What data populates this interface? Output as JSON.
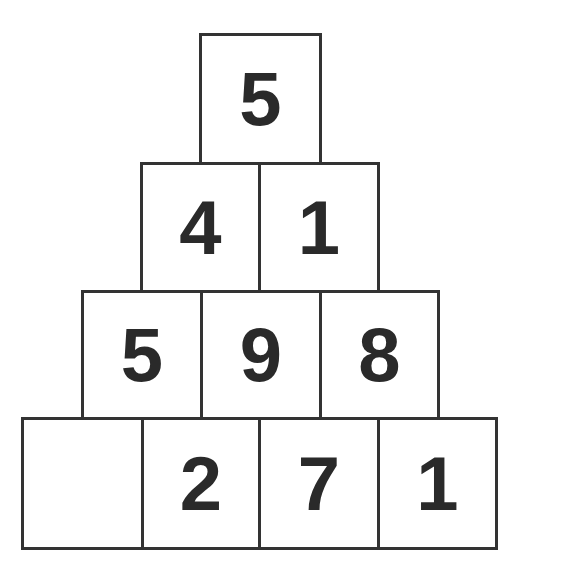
{
  "colors": {
    "border": "#333333",
    "text": "#2a2a2a",
    "background": "#ffffff"
  },
  "rows": [
    {
      "cells": [
        {
          "value": "5"
        }
      ]
    },
    {
      "cells": [
        {
          "value": "4"
        },
        {
          "value": "1"
        }
      ]
    },
    {
      "cells": [
        {
          "value": "5"
        },
        {
          "value": "9"
        },
        {
          "value": "8"
        }
      ]
    },
    {
      "cells": [
        {
          "value": ""
        },
        {
          "value": "2"
        },
        {
          "value": "7"
        },
        {
          "value": "1"
        }
      ]
    }
  ]
}
